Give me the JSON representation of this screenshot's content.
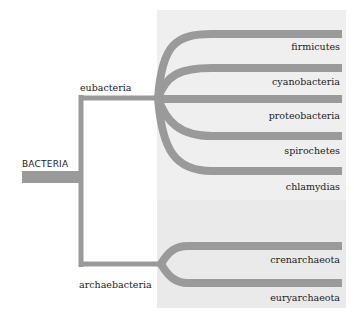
{
  "diagram": {
    "type": "phylogenetic-tree",
    "root": {
      "label": "BACTERIA"
    },
    "groups": [
      {
        "label": "eubacteria",
        "leaves": [
          "firmicutes",
          "cyanobacteria",
          "proteobacteria",
          "spirochetes",
          "chlamydias"
        ]
      },
      {
        "label": "archaebacteria",
        "leaves": [
          "crenarchaeota",
          "euryarchaeota"
        ]
      }
    ]
  },
  "colors": {
    "line": "#9a9a9a",
    "panel_top": "#efefef",
    "panel_bottom": "#eaeaea",
    "text": "#222222"
  }
}
